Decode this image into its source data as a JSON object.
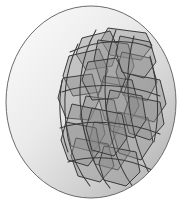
{
  "figure": {
    "canvas": {
      "width": 186,
      "height": 204,
      "background": "#ffffff"
    },
    "sphere": {
      "name": "shaded-sphere",
      "cx": 91,
      "cy": 102,
      "rx": 85,
      "ry": 96,
      "outline_color": "#6b6b6b",
      "outline_width": 1,
      "gradient": {
        "type": "linear-diagonal",
        "from_color": "#fdfdfd",
        "mid_color": "#e2e2e2",
        "to_color": "#a9a9a9",
        "direction": "top-left to bottom-right"
      }
    },
    "shapes_style": {
      "stroke_color": "#3a3a3a",
      "stroke_width": 1,
      "fill_color": "#8a8a8a",
      "fill_opacity": 0.42
    },
    "polygons": [
      {
        "id": "p01",
        "points": "108,28 146,33 152,46 141,60 110,55 101,40"
      },
      {
        "id": "p02",
        "points": "82,38 110,31 118,48 112,66 86,70 76,54"
      },
      {
        "id": "p03",
        "points": "69,56 99,49 108,70 100,92 73,96 63,76"
      },
      {
        "id": "p04",
        "points": "63,78 92,74 99,100 90,120 66,118 58,98"
      },
      {
        "id": "p05",
        "points": "98,40 128,44 134,66 125,86 101,82 94,60"
      },
      {
        "id": "p06",
        "points": "122,52 150,58 157,82 147,101 123,95 116,72"
      },
      {
        "id": "p07",
        "points": "130,74 160,80 166,104 154,122 131,115 124,94"
      },
      {
        "id": "p08",
        "points": "104,76 132,80 139,106 128,126 105,120 98,96"
      },
      {
        "id": "p09",
        "points": "86,96 114,100 120,126 110,146 87,140 80,116"
      },
      {
        "id": "p10",
        "points": "72,104 100,110 105,134 94,152 71,146 66,124"
      },
      {
        "id": "p11",
        "points": "94,122 124,128 130,152 118,170 95,164 89,142"
      },
      {
        "id": "p12",
        "points": "118,112 148,118 153,142 141,160 119,153 113,132"
      },
      {
        "id": "p13",
        "points": "76,138 108,144 114,166 100,182 78,176 71,156"
      },
      {
        "id": "p14",
        "points": "104,146 136,152 140,172 126,186 104,180 99,164"
      },
      {
        "id": "p15",
        "points": "130,96 160,102 164,124 150,140 129,133 124,114"
      },
      {
        "id": "p16",
        "points": "88,62 116,58 126,78 118,98 92,100 82,80"
      },
      {
        "id": "p17",
        "points": "110,90 142,96 146,120 134,138 111,131 106,108"
      },
      {
        "id": "p18",
        "points": "66,122 96,128 100,150 88,166 68,160 61,140"
      },
      {
        "id": "p19",
        "points": "120,36 150,42 156,62 144,78 122,72 116,52"
      },
      {
        "id": "p20",
        "points": "92,108 122,114 127,138 114,156 92,150 86,128"
      }
    ],
    "curves": [
      {
        "id": "c01",
        "d": "M 96 30 C 80 58, 76 92, 84 130 C 90 158, 100 176, 110 188"
      },
      {
        "id": "c02",
        "d": "M 116 30 C 104 60, 102 96, 110 132 C 116 160, 126 178, 134 188"
      },
      {
        "id": "c03",
        "d": "M 134 36 C 126 64, 126 98, 134 132 C 140 158, 148 172, 154 182"
      },
      {
        "id": "c04",
        "d": "M 78 44 C 64 72, 62 104, 68 138 C 73 162, 82 176, 90 186"
      },
      {
        "id": "c05",
        "d": "M 62 80 C 58 104, 60 130, 68 152"
      },
      {
        "id": "c06",
        "d": "M 150 56 C 158 84, 160 114, 154 142"
      },
      {
        "id": "c07",
        "d": "M 70 52 C 96 40, 128 38, 152 48"
      },
      {
        "id": "c08",
        "d": "M 62 92 C 92 82, 130 84, 160 96"
      },
      {
        "id": "c09",
        "d": "M 60 128 C 90 118, 130 122, 160 134"
      },
      {
        "id": "c10",
        "d": "M 68 162 C 96 154, 128 158, 152 170"
      }
    ]
  }
}
